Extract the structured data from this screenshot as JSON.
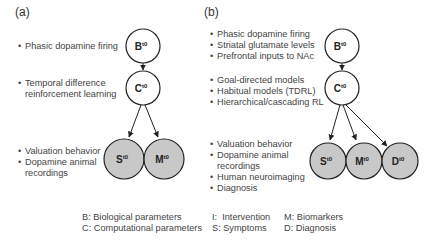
{
  "panel_a": {
    "label": "(a)",
    "groups": [
      {
        "bullets": [
          "Phasic dopamine firing"
        ]
      },
      {
        "bullets": [
          "Temporal difference",
          "reinforcement learning"
        ]
      },
      {
        "bullets": [
          "Valuation behavior",
          "Dopamine animal",
          "recordings"
        ]
      }
    ],
    "nodes": [
      {
        "id": "B",
        "letter": "B",
        "sup": "t0",
        "fill": "#ffffff"
      },
      {
        "id": "C",
        "letter": "C",
        "sup": "t0",
        "fill": "#ffffff"
      },
      {
        "id": "S",
        "letter": "S",
        "sup": "t0",
        "fill": "#c8c8c8"
      },
      {
        "id": "M",
        "letter": "M",
        "sup": "t0",
        "fill": "#c8c8c8"
      }
    ],
    "edges": [
      [
        "B",
        "C"
      ],
      [
        "C",
        "S"
      ],
      [
        "C",
        "M"
      ]
    ]
  },
  "panel_b": {
    "label": "(b)",
    "groups": [
      {
        "bullets": [
          "Phasic dopamine firing",
          "Striatal glutamate levels",
          "Prefrontal inputs to NAc"
        ]
      },
      {
        "bullets": [
          "Goal-directed models",
          "Habitual models  (TDRL)",
          "Hierarchical/cascading RL"
        ]
      },
      {
        "bullets": [
          "Valuation behavior",
          "Dopamine animal",
          "recordings",
          "Human neuroimaging",
          "Diagnosis"
        ]
      }
    ],
    "nodes": [
      {
        "id": "B",
        "letter": "B",
        "sup": "t0",
        "fill": "#ffffff"
      },
      {
        "id": "C",
        "letter": "C",
        "sup": "t0",
        "fill": "#ffffff"
      },
      {
        "id": "S",
        "letter": "S",
        "sup": "t0",
        "fill": "#c8c8c8"
      },
      {
        "id": "M",
        "letter": "M",
        "sup": "t0",
        "fill": "#c8c8c8"
      },
      {
        "id": "D",
        "letter": "D",
        "sup": "t0",
        "fill": "#c8c8c8"
      }
    ],
    "edges": [
      [
        "B",
        "C"
      ],
      [
        "C",
        "S"
      ],
      [
        "C",
        "M"
      ],
      [
        "C",
        "D"
      ]
    ]
  },
  "legend": {
    "col1": [
      "B: Biological parameters",
      "C: Computational parameters"
    ],
    "col2": [
      "I:  Intervention",
      "S: Symptoms"
    ],
    "col3": [
      "M: Biomarkers",
      "D: Diagnosis"
    ]
  },
  "colors": {
    "stroke": "#222222",
    "node_white": "#ffffff",
    "node_gray": "#c8c8c8",
    "text": "#444444"
  }
}
